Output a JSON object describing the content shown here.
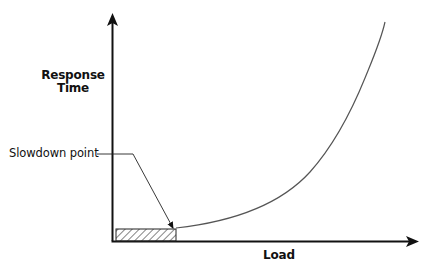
{
  "diagram": {
    "type": "response-time-vs-load",
    "y_axis": {
      "label_line1": "Response",
      "label_line2": "Time"
    },
    "x_axis": {
      "label": "Load"
    },
    "annotation": {
      "label": "Slowdown point"
    },
    "colors": {
      "axis": "#111111",
      "curve": "#555555",
      "hatch": "#333333",
      "background": "#ffffff"
    }
  }
}
